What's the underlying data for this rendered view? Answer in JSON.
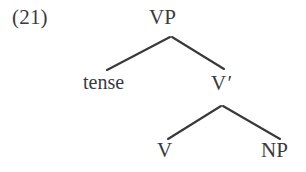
{
  "figure": {
    "example_number": "(21)",
    "type": "syntax-tree",
    "background_color": "#ffffff",
    "ink_color": "#3a3a3c"
  },
  "tree": {
    "nodes": [
      {
        "id": "vp",
        "label": "VP",
        "x": 171,
        "y": 18,
        "role": "root"
      },
      {
        "id": "tense",
        "label": "tense",
        "x": 110,
        "y": 82,
        "role": "leaf-specifier"
      },
      {
        "id": "vbar",
        "label": "V",
        "prime": "′",
        "x": 224,
        "y": 83,
        "role": "intermediate"
      },
      {
        "id": "v",
        "label": "V",
        "x": 167,
        "y": 150,
        "role": "leaf-head"
      },
      {
        "id": "np",
        "label": "NP",
        "x": 279,
        "y": 150,
        "role": "leaf-complement"
      }
    ],
    "edges": [
      {
        "from": "vp",
        "to": "tense",
        "x1": 170,
        "y1": 37,
        "x2": 107,
        "y2": 70
      },
      {
        "from": "vp",
        "to": "vbar",
        "x1": 172,
        "y1": 37,
        "x2": 224,
        "y2": 69
      },
      {
        "from": "vbar",
        "to": "v",
        "x1": 221,
        "y1": 106,
        "x2": 168,
        "y2": 139
      },
      {
        "from": "vbar",
        "to": "np",
        "x1": 223,
        "y1": 106,
        "x2": 280,
        "y2": 139
      }
    ]
  },
  "labels": {
    "vp": "VP",
    "tense": "tense",
    "vbar_base": "V",
    "vbar_prime": "′",
    "v": "V",
    "np": "NP"
  }
}
